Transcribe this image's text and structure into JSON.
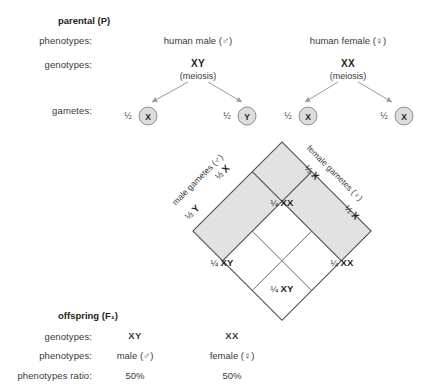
{
  "parental": {
    "section_title": "parental (P)",
    "labels": {
      "phenotypes": "phenotypes:",
      "genotypes": "genotypes:",
      "gametes": "gametes:"
    },
    "male_parent": {
      "phenotype": "human male (♂)",
      "genotype": "XY",
      "process": "(meiosis)",
      "gametes": [
        {
          "fraction": "½",
          "allele": "X"
        },
        {
          "fraction": "½",
          "allele": "Y"
        }
      ]
    },
    "female_parent": {
      "phenotype": "human female (♀)",
      "genotype": "XX",
      "process": "(meiosis)",
      "gametes": [
        {
          "fraction": "½",
          "allele": "X"
        },
        {
          "fraction": "½",
          "allele": "X"
        }
      ]
    }
  },
  "punnett": {
    "male_axis_label": "male gametes (♂)",
    "female_axis_label": "female gametes (♀)",
    "male_headers": [
      {
        "fraction": "½",
        "allele": "X"
      },
      {
        "fraction": "½",
        "allele": "Y"
      }
    ],
    "female_headers": [
      {
        "fraction": "½",
        "allele": "X"
      },
      {
        "fraction": "½",
        "allele": "X"
      }
    ],
    "cells": [
      {
        "position": "top",
        "fraction": "¼",
        "genotype": "XX"
      },
      {
        "position": "left",
        "fraction": "¼",
        "genotype": "XY"
      },
      {
        "position": "right",
        "fraction": "¼",
        "genotype": "XX"
      },
      {
        "position": "bottom",
        "fraction": "¼",
        "genotype": "XY"
      }
    ],
    "band_color": "#e2e2e2",
    "line_color": "#4d4d4d"
  },
  "offspring": {
    "section_title": "offspring (F₁)",
    "labels": {
      "genotypes": "genotypes:",
      "phenotypes": "phenotypes:",
      "ratio": "phenotypes ratio:"
    },
    "columns": [
      {
        "genotype": "XY",
        "phenotype": "male (♂)",
        "ratio": "50%"
      },
      {
        "genotype": "XX",
        "phenotype": "female (♀)",
        "ratio": "50%"
      }
    ]
  }
}
